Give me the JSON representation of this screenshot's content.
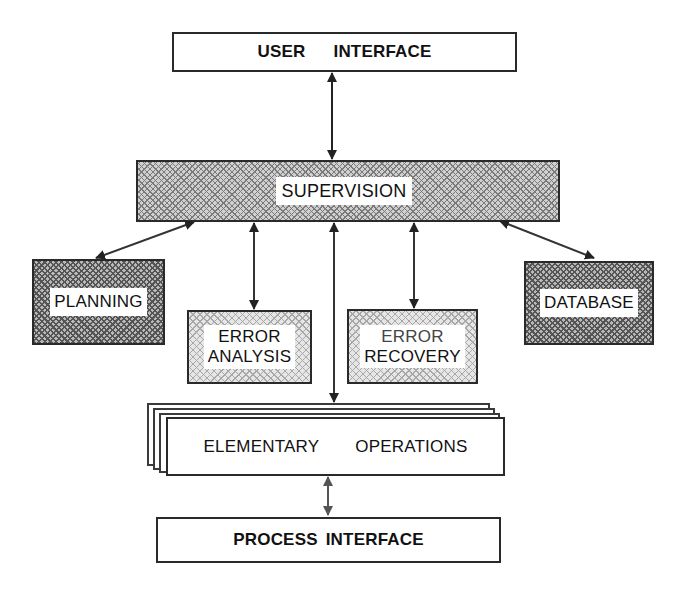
{
  "diagram": {
    "nodes": {
      "user_interface": {
        "word1": "USER",
        "word2": "INTERFACE"
      },
      "supervision": {
        "label": "SUPERVISION"
      },
      "planning": {
        "label": "PLANNING"
      },
      "error_analysis": {
        "line1": "ERROR",
        "line2": "ANALYSIS"
      },
      "error_recovery": {
        "line1": "ERROR",
        "line2": "RECOVERY"
      },
      "database": {
        "label": "DATABASE"
      },
      "elementary_operations": {
        "word1": "ELEMENTARY",
        "word2": "OPERATIONS"
      },
      "process_interface": {
        "label": "PROCESS INTERFACE"
      }
    },
    "edges": [
      {
        "from": "USER INTERFACE",
        "to": "SUPERVISION",
        "type": "bidirectional"
      },
      {
        "from": "SUPERVISION",
        "to": "PLANNING",
        "type": "bidirectional"
      },
      {
        "from": "SUPERVISION",
        "to": "ERROR ANALYSIS",
        "type": "bidirectional"
      },
      {
        "from": "SUPERVISION",
        "to": "ELEMENTARY OPERATIONS",
        "type": "bidirectional"
      },
      {
        "from": "SUPERVISION",
        "to": "ERROR RECOVERY",
        "type": "bidirectional"
      },
      {
        "from": "SUPERVISION",
        "to": "DATABASE",
        "type": "bidirectional"
      },
      {
        "from": "ELEMENTARY OPERATIONS",
        "to": "PROCESS INTERFACE",
        "type": "bidirectional"
      }
    ],
    "colors": {
      "stroke": "#2a2a2a",
      "background": "#ffffff",
      "hatch": "#7a7a7a"
    }
  }
}
